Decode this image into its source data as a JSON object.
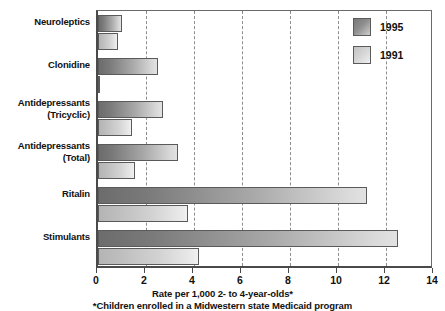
{
  "chart_data": {
    "type": "bar",
    "orientation": "horizontal",
    "title": "",
    "xlabel": "Rate per 1,000 2- to 4-year-olds*",
    "ylabel": "",
    "footnote": "*Children enrolled in a Midwestern state Medicaid program",
    "xlim": [
      0,
      14
    ],
    "xticks": [
      0,
      2,
      4,
      6,
      8,
      10,
      12,
      14
    ],
    "xtick_labels": [
      "0",
      "2",
      "4",
      "6",
      "8",
      "10",
      "12",
      "14"
    ],
    "grid": "vertical-dashed",
    "legend_position": "top-right",
    "categories": [
      "Neuroleptics",
      "Clonidine",
      "Antidepressants (Tricyclic)",
      "Antidepressants (Total)",
      "Ritalin",
      "Stimulants"
    ],
    "category_lines": [
      [
        "Neuroleptics"
      ],
      [
        "Clonidine"
      ],
      [
        "Antidepressants",
        "(Tricyclic)"
      ],
      [
        "Antidepressants",
        "(Total)"
      ],
      [
        "Ritalin"
      ],
      [
        "Stimulants"
      ]
    ],
    "series": [
      {
        "name": "1995",
        "color": "#7a7a7a",
        "values": [
          1.0,
          2.5,
          2.7,
          3.35,
          11.2,
          12.5
        ]
      },
      {
        "name": "1991",
        "color": "#cfcfcf",
        "values": [
          0.85,
          0.1,
          1.4,
          1.55,
          3.75,
          4.2
        ]
      }
    ]
  },
  "legend": {
    "items": [
      {
        "label": "1995",
        "swatch": "legend-swatch-1995"
      },
      {
        "label": "1991",
        "swatch": "legend-swatch-1991"
      }
    ]
  }
}
